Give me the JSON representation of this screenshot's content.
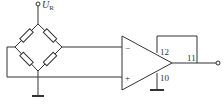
{
  "diagram": {
    "type": "circuit",
    "supply_label": {
      "main": "U",
      "sub": "R"
    },
    "opamp": {
      "inputs": {
        "inverting": "−",
        "non_inverting": "+"
      },
      "pins": {
        "pin_12": "12",
        "pin_11": "11",
        "pin_10": "10"
      }
    },
    "bridge": {
      "resistor_count": 4
    }
  }
}
